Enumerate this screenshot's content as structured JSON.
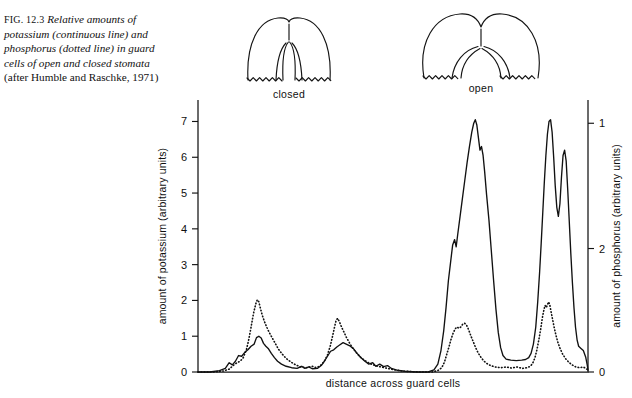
{
  "caption": {
    "figure_number": "FIG. 12.3",
    "text_part1": "Relative amounts of potassium (continuous line) and phosphorus (dotted line) in guard cells of open and closed stomata",
    "text_part2": "(after Humble and Raschke, 1971)"
  },
  "diagrams": [
    {
      "name": "closed-stoma",
      "label": "closed"
    },
    {
      "name": "open-stoma",
      "label": "open"
    }
  ],
  "chart_data": {
    "type": "line",
    "title": "",
    "xlabel": "distance across guard cells",
    "ylabel": "amount of potassium (arbitrary units)",
    "y2label": "amount of phosphorus (arbitrary units)",
    "grid": false,
    "legend": "none",
    "xlim": [
      0,
      100
    ],
    "ylim": [
      0,
      7.6
    ],
    "y_ticks": [
      0,
      1,
      2,
      3,
      4,
      5,
      6,
      7
    ],
    "y_tick_labels": [
      "0",
      "1",
      "2",
      "3",
      "4",
      "5",
      "6",
      "7"
    ],
    "y2_ticks": [
      0,
      2,
      1
    ],
    "y2_tick_labels": [
      "0",
      "2",
      "1"
    ],
    "y2_tick_positions": [
      0.0,
      3.45,
      6.95
    ],
    "series": [
      {
        "name": "potassium",
        "style": "continuous line",
        "axis": "left",
        "points": [
          [
            0.0,
            0.0
          ],
          [
            3.0,
            0.0
          ],
          [
            5.5,
            0.04
          ],
          [
            7.0,
            0.1
          ],
          [
            8.0,
            0.26
          ],
          [
            8.8,
            0.2
          ],
          [
            9.6,
            0.3
          ],
          [
            10.4,
            0.46
          ],
          [
            11.2,
            0.44
          ],
          [
            12.0,
            0.55
          ],
          [
            12.8,
            0.62
          ],
          [
            13.6,
            0.72
          ],
          [
            14.4,
            0.78
          ],
          [
            15.0,
            0.96
          ],
          [
            15.6,
            1.0
          ],
          [
            16.2,
            0.95
          ],
          [
            16.8,
            0.8
          ],
          [
            17.4,
            0.72
          ],
          [
            18.0,
            0.66
          ],
          [
            18.8,
            0.52
          ],
          [
            19.6,
            0.4
          ],
          [
            20.4,
            0.3
          ],
          [
            21.4,
            0.22
          ],
          [
            22.6,
            0.16
          ],
          [
            24.0,
            0.12
          ],
          [
            25.4,
            0.1
          ],
          [
            26.6,
            0.16
          ],
          [
            27.4,
            0.1
          ],
          [
            28.4,
            0.14
          ],
          [
            29.4,
            0.09
          ],
          [
            30.6,
            0.1
          ],
          [
            31.6,
            0.18
          ],
          [
            32.4,
            0.3
          ],
          [
            33.2,
            0.44
          ],
          [
            34.0,
            0.58
          ],
          [
            34.8,
            0.62
          ],
          [
            35.6,
            0.7
          ],
          [
            36.4,
            0.76
          ],
          [
            37.2,
            0.82
          ],
          [
            38.0,
            0.78
          ],
          [
            38.8,
            0.74
          ],
          [
            39.8,
            0.66
          ],
          [
            40.8,
            0.52
          ],
          [
            41.8,
            0.4
          ],
          [
            42.8,
            0.3
          ],
          [
            43.8,
            0.22
          ],
          [
            44.8,
            0.26
          ],
          [
            45.6,
            0.16
          ],
          [
            46.6,
            0.22
          ],
          [
            47.6,
            0.15
          ],
          [
            48.6,
            0.18
          ],
          [
            49.6,
            0.1
          ],
          [
            51.0,
            0.05
          ],
          [
            53.0,
            0.02
          ],
          [
            56.0,
            0.0
          ],
          [
            59.0,
            0.0
          ],
          [
            60.5,
            0.06
          ],
          [
            61.5,
            0.22
          ],
          [
            62.3,
            0.6
          ],
          [
            63.0,
            1.15
          ],
          [
            63.6,
            1.8
          ],
          [
            64.2,
            2.55
          ],
          [
            64.8,
            3.1
          ],
          [
            65.3,
            3.55
          ],
          [
            65.8,
            3.7
          ],
          [
            66.2,
            3.5
          ],
          [
            66.6,
            3.85
          ],
          [
            67.2,
            4.35
          ],
          [
            67.8,
            4.85
          ],
          [
            68.4,
            5.35
          ],
          [
            69.0,
            5.85
          ],
          [
            69.6,
            6.3
          ],
          [
            70.2,
            6.7
          ],
          [
            70.7,
            6.95
          ],
          [
            71.1,
            7.05
          ],
          [
            71.5,
            6.9
          ],
          [
            71.9,
            6.55
          ],
          [
            72.3,
            6.2
          ],
          [
            72.7,
            6.3
          ],
          [
            73.1,
            6.05
          ],
          [
            73.5,
            5.6
          ],
          [
            74.0,
            4.95
          ],
          [
            74.6,
            4.25
          ],
          [
            75.2,
            3.4
          ],
          [
            75.8,
            2.55
          ],
          [
            76.4,
            1.75
          ],
          [
            77.0,
            1.1
          ],
          [
            77.6,
            0.68
          ],
          [
            78.2,
            0.46
          ],
          [
            79.0,
            0.36
          ],
          [
            80.2,
            0.33
          ],
          [
            81.6,
            0.32
          ],
          [
            83.0,
            0.33
          ],
          [
            84.0,
            0.35
          ],
          [
            84.8,
            0.4
          ],
          [
            85.4,
            0.52
          ],
          [
            86.0,
            0.78
          ],
          [
            86.6,
            1.25
          ],
          [
            87.1,
            1.95
          ],
          [
            87.6,
            2.8
          ],
          [
            88.0,
            3.6
          ],
          [
            88.4,
            4.45
          ],
          [
            88.8,
            5.3
          ],
          [
            89.2,
            6.05
          ],
          [
            89.6,
            6.65
          ],
          [
            90.0,
            7.0
          ],
          [
            90.4,
            7.05
          ],
          [
            90.8,
            6.7
          ],
          [
            91.2,
            6.0
          ],
          [
            91.6,
            5.2
          ],
          [
            92.0,
            4.6
          ],
          [
            92.4,
            4.35
          ],
          [
            92.8,
            4.7
          ],
          [
            93.2,
            5.45
          ],
          [
            93.6,
            6.05
          ],
          [
            94.0,
            6.2
          ],
          [
            94.4,
            5.9
          ],
          [
            94.8,
            5.1
          ],
          [
            95.2,
            4.2
          ],
          [
            95.6,
            3.3
          ],
          [
            96.0,
            2.5
          ],
          [
            96.4,
            1.8
          ],
          [
            96.8,
            1.25
          ],
          [
            97.2,
            0.9
          ],
          [
            97.6,
            0.72
          ],
          [
            98.2,
            0.66
          ],
          [
            98.8,
            0.6
          ],
          [
            99.4,
            0.42
          ],
          [
            99.8,
            0.2
          ],
          [
            100.0,
            0.05
          ]
        ]
      },
      {
        "name": "phosphorus",
        "style": "dotted line",
        "axis": "right",
        "points": [
          [
            0.0,
            0.0
          ],
          [
            4.0,
            0.0
          ],
          [
            6.5,
            0.03
          ],
          [
            8.0,
            0.08
          ],
          [
            9.0,
            0.18
          ],
          [
            10.0,
            0.26
          ],
          [
            10.8,
            0.3
          ],
          [
            11.6,
            0.4
          ],
          [
            12.4,
            0.62
          ],
          [
            13.0,
            0.9
          ],
          [
            13.6,
            1.25
          ],
          [
            14.2,
            1.62
          ],
          [
            14.8,
            1.9
          ],
          [
            15.2,
            2.02
          ],
          [
            15.6,
            1.96
          ],
          [
            16.0,
            1.78
          ],
          [
            16.5,
            1.58
          ],
          [
            17.0,
            1.42
          ],
          [
            17.6,
            1.26
          ],
          [
            18.2,
            1.12
          ],
          [
            19.0,
            0.96
          ],
          [
            19.8,
            0.8
          ],
          [
            20.6,
            0.64
          ],
          [
            21.6,
            0.5
          ],
          [
            22.6,
            0.38
          ],
          [
            23.8,
            0.28
          ],
          [
            25.0,
            0.2
          ],
          [
            26.4,
            0.14
          ],
          [
            27.8,
            0.12
          ],
          [
            29.2,
            0.16
          ],
          [
            30.4,
            0.12
          ],
          [
            31.4,
            0.18
          ],
          [
            32.4,
            0.3
          ],
          [
            33.2,
            0.48
          ],
          [
            33.9,
            0.72
          ],
          [
            34.5,
            1.0
          ],
          [
            35.0,
            1.25
          ],
          [
            35.4,
            1.44
          ],
          [
            35.8,
            1.5
          ],
          [
            36.2,
            1.42
          ],
          [
            36.8,
            1.26
          ],
          [
            37.4,
            1.12
          ],
          [
            38.0,
            0.98
          ],
          [
            38.8,
            0.82
          ],
          [
            39.6,
            0.68
          ],
          [
            40.6,
            0.54
          ],
          [
            41.6,
            0.42
          ],
          [
            42.8,
            0.32
          ],
          [
            44.0,
            0.24
          ],
          [
            45.4,
            0.18
          ],
          [
            47.0,
            0.14
          ],
          [
            48.6,
            0.1
          ],
          [
            50.4,
            0.06
          ],
          [
            53.0,
            0.02
          ],
          [
            57.0,
            0.0
          ],
          [
            60.0,
            0.0
          ],
          [
            61.5,
            0.04
          ],
          [
            62.5,
            0.12
          ],
          [
            63.2,
            0.28
          ],
          [
            63.8,
            0.5
          ],
          [
            64.4,
            0.72
          ],
          [
            64.9,
            0.92
          ],
          [
            65.4,
            1.08
          ],
          [
            65.9,
            1.2
          ],
          [
            66.4,
            1.26
          ],
          [
            66.9,
            1.22
          ],
          [
            67.4,
            1.26
          ],
          [
            67.9,
            1.34
          ],
          [
            68.4,
            1.36
          ],
          [
            68.9,
            1.3
          ],
          [
            69.4,
            1.18
          ],
          [
            70.0,
            1.0
          ],
          [
            70.6,
            0.84
          ],
          [
            71.2,
            0.68
          ],
          [
            71.8,
            0.54
          ],
          [
            72.5,
            0.42
          ],
          [
            73.2,
            0.32
          ],
          [
            74.0,
            0.24
          ],
          [
            75.0,
            0.18
          ],
          [
            76.2,
            0.14
          ],
          [
            77.6,
            0.12
          ],
          [
            79.0,
            0.14
          ],
          [
            80.4,
            0.11
          ],
          [
            81.8,
            0.14
          ],
          [
            83.2,
            0.1
          ],
          [
            84.4,
            0.12
          ],
          [
            85.2,
            0.16
          ],
          [
            85.8,
            0.24
          ],
          [
            86.4,
            0.4
          ],
          [
            86.9,
            0.62
          ],
          [
            87.4,
            0.9
          ],
          [
            87.9,
            1.22
          ],
          [
            88.3,
            1.52
          ],
          [
            88.7,
            1.74
          ],
          [
            89.0,
            1.86
          ],
          [
            89.3,
            1.8
          ],
          [
            89.6,
            1.88
          ],
          [
            89.9,
            1.96
          ],
          [
            90.2,
            1.88
          ],
          [
            90.5,
            1.7
          ],
          [
            90.9,
            1.48
          ],
          [
            91.3,
            1.26
          ],
          [
            91.8,
            1.02
          ],
          [
            92.3,
            0.82
          ],
          [
            92.9,
            0.64
          ],
          [
            93.5,
            0.5
          ],
          [
            94.2,
            0.38
          ],
          [
            95.0,
            0.28
          ],
          [
            95.9,
            0.2
          ],
          [
            96.9,
            0.14
          ],
          [
            97.9,
            0.12
          ],
          [
            98.8,
            0.14
          ],
          [
            99.4,
            0.1
          ],
          [
            100.0,
            0.06
          ]
        ]
      }
    ]
  }
}
